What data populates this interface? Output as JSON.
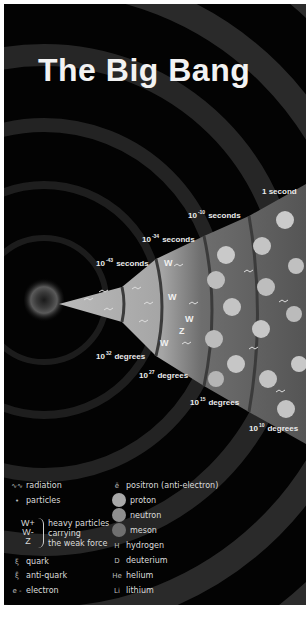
{
  "title": "The Big Bang",
  "colors": {
    "background": "#030303",
    "border": "#ffffff",
    "text": "#ececec",
    "cone_light": "#b8b8b8",
    "cone_mid": "#7a7a7a",
    "cone_dark": "#4a4a4a",
    "proton": "#a8a8a8",
    "neutron": "#8e8e8e",
    "meson": "#6f6f6f"
  },
  "time_labels": [
    {
      "base": "10",
      "exp": "-43",
      "unit": "seconds"
    },
    {
      "base": "10",
      "exp": "-34",
      "unit": "seconds"
    },
    {
      "base": "10",
      "exp": "-10",
      "unit": "seconds"
    },
    {
      "text": "1 second"
    }
  ],
  "temperature_labels": [
    {
      "base": "10",
      "exp": "32",
      "unit": "degrees"
    },
    {
      "base": "10",
      "exp": "27",
      "unit": "degrees"
    },
    {
      "base": "10",
      "exp": "15",
      "unit": "degrees"
    },
    {
      "base": "10",
      "exp": "10",
      "unit": "degrees"
    }
  ],
  "legend": {
    "left": [
      {
        "glyph": "∿∿",
        "label": "radiation"
      },
      {
        "glyph": "•",
        "label": "particles"
      },
      {
        "glyph": "ξ",
        "label": "quark"
      },
      {
        "glyph": "ξ̄",
        "label": "anti-quark"
      },
      {
        "glyph": "e -",
        "label": "electron"
      }
    ],
    "heavy_particles": {
      "symbols": [
        "W+",
        "W-",
        "Z"
      ],
      "description": [
        "heavy particles",
        "carrying",
        "the weak force"
      ]
    },
    "right": [
      {
        "glyph": "ē",
        "label": "positron (anti-electron)"
      },
      {
        "glyph": "ball",
        "label": "proton"
      },
      {
        "glyph": "ball",
        "label": "neutron"
      },
      {
        "glyph": "ball",
        "label": "meson"
      },
      {
        "glyph": "H",
        "label": "hydrogen"
      },
      {
        "glyph": "D",
        "label": "deuterium"
      },
      {
        "glyph": "He",
        "label": "helium"
      },
      {
        "glyph": "Li",
        "label": "lithium"
      }
    ]
  }
}
